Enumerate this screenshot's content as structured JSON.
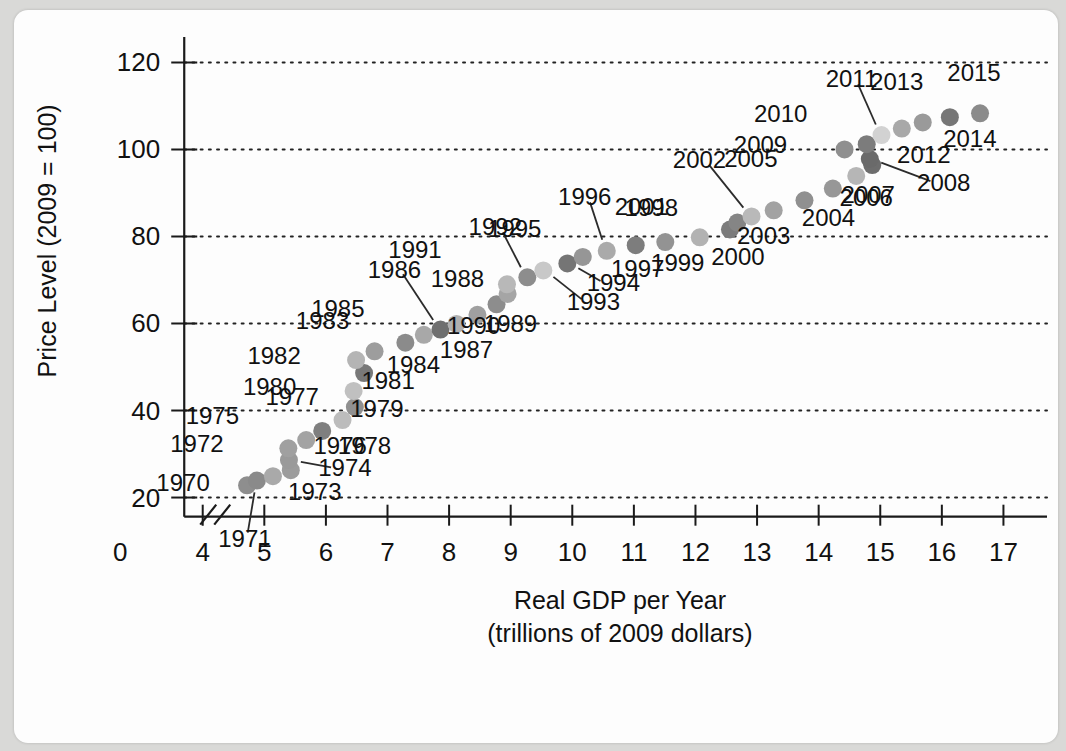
{
  "chart_data": {
    "type": "scatter",
    "title": "",
    "xlabel": "Real GDP per Year",
    "xlabel_line2": "(trillions of 2009 dollars)",
    "ylabel": "Price Level (2009 = 100)",
    "xlim": [
      3.55,
      17.35
    ],
    "ylim": [
      13.0,
      124.0
    ],
    "xticks": [
      4,
      5,
      6,
      7,
      8,
      9,
      10,
      11,
      12,
      13,
      14,
      15,
      16,
      17
    ],
    "yticks": [
      20,
      40,
      60,
      80,
      100,
      120
    ],
    "origin_label": "0",
    "axis_break": true,
    "grid": "horizontal-dotted",
    "legend": "none",
    "x_name": "Real GDP (trillions of 2009 dollars)",
    "y_name": "Price Level (2009 = 100)",
    "point_label_key": "year",
    "points": [
      {
        "year": "1970",
        "x": 4.72,
        "y": 22.8,
        "shade": "#8e8e8e",
        "label_dx": -64,
        "label_dy": 6,
        "leader": false
      },
      {
        "year": "1971",
        "x": 4.88,
        "y": 23.9,
        "shade": "#8a8a8a",
        "label_dx": -12,
        "label_dy": 66,
        "leader": true
      },
      {
        "year": "1972",
        "x": 5.14,
        "y": 24.9,
        "shade": "#a9a9a9",
        "label_dx": -76,
        "label_dy": -24,
        "leader": false
      },
      {
        "year": "1973",
        "x": 5.43,
        "y": 26.3,
        "shade": "#9c9c9c",
        "label_dx": 24,
        "label_dy": 30,
        "leader": false
      },
      {
        "year": "1974",
        "x": 5.4,
        "y": 28.6,
        "shade": "#9a9a9a",
        "label_dx": 56,
        "label_dy": 16,
        "leader": true
      },
      {
        "year": "1975",
        "x": 5.39,
        "y": 31.3,
        "shade": "#a0a0a0",
        "label_dx": -76,
        "label_dy": -24,
        "leader": false
      },
      {
        "year": "1976",
        "x": 5.68,
        "y": 33.2,
        "shade": "#a3a3a3",
        "label_dx": 34,
        "label_dy": 14,
        "leader": false
      },
      {
        "year": "1977",
        "x": 5.94,
        "y": 35.3,
        "shade": "#7f7f7f",
        "label_dx": -30,
        "label_dy": -26,
        "leader": false
      },
      {
        "year": "1978",
        "x": 6.27,
        "y": 37.8,
        "shade": "#bcbcbc",
        "label_dx": 22,
        "label_dy": 34,
        "leader": false
      },
      {
        "year": "1979",
        "x": 6.47,
        "y": 40.8,
        "shade": "#909090",
        "label_dx": 22,
        "label_dy": 10,
        "leader": false
      },
      {
        "year": "1980",
        "x": 6.45,
        "y": 44.5,
        "shade": "#c0c0c0",
        "label_dx": -84,
        "label_dy": 4,
        "leader": false
      },
      {
        "year": "1981",
        "x": 6.62,
        "y": 48.6,
        "shade": "#787878",
        "label_dx": 24,
        "label_dy": 16,
        "leader": false
      },
      {
        "year": "1982",
        "x": 6.49,
        "y": 51.6,
        "shade": "#b4b4b4",
        "label_dx": -82,
        "label_dy": 4,
        "leader": false
      },
      {
        "year": "1983",
        "x": 6.79,
        "y": 53.6,
        "shade": "#9d9d9d",
        "label_dx": -52,
        "label_dy": -22,
        "leader": false
      },
      {
        "year": "1984",
        "x": 7.29,
        "y": 55.6,
        "shade": "#8b8b8b",
        "label_dx": 8,
        "label_dy": 30,
        "leader": false
      },
      {
        "year": "1985",
        "x": 7.59,
        "y": 57.4,
        "shade": "#a8a8a8",
        "label_dx": -86,
        "label_dy": -18,
        "leader": false
      },
      {
        "year": "1986",
        "x": 7.86,
        "y": 58.6,
        "shade": "#6f6f6f",
        "label_dx": -46,
        "label_dy": -52,
        "leader": true
      },
      {
        "year": "1987",
        "x": 8.12,
        "y": 59.9,
        "shade": "#b0b0b0",
        "label_dx": 10,
        "label_dy": 34,
        "leader": false
      },
      {
        "year": "1988",
        "x": 8.46,
        "y": 62.0,
        "shade": "#a0a0a0",
        "label_dx": -20,
        "label_dy": -28,
        "leader": false
      },
      {
        "year": "1989",
        "x": 8.77,
        "y": 64.4,
        "shade": "#8d8d8d",
        "label_dx": 14,
        "label_dy": 28,
        "leader": false
      },
      {
        "year": "1990",
        "x": 8.95,
        "y": 66.8,
        "shade": "#a5a5a5",
        "label_dx": -34,
        "label_dy": 40,
        "leader": false
      },
      {
        "year": "1991",
        "x": 8.94,
        "y": 69.0,
        "shade": "#b8b8b8",
        "label_dx": -92,
        "label_dy": -26,
        "leader": false
      },
      {
        "year": "1992",
        "x": 9.27,
        "y": 70.6,
        "shade": "#8d8d8d",
        "label_dx": -32,
        "label_dy": -42,
        "leader": true
      },
      {
        "year": "1993",
        "x": 9.53,
        "y": 72.2,
        "shade": "#c8c8c8",
        "label_dx": 50,
        "label_dy": 40,
        "leader": true
      },
      {
        "year": "1994",
        "x": 9.92,
        "y": 73.8,
        "shade": "#757575",
        "label_dx": 46,
        "label_dy": 28,
        "leader": true
      },
      {
        "year": "1995",
        "x": 10.17,
        "y": 75.3,
        "shade": "#969696",
        "label_dx": -68,
        "label_dy": -20,
        "leader": false
      },
      {
        "year": "1996",
        "x": 10.56,
        "y": 76.7,
        "shade": "#aaaaaa",
        "label_dx": -22,
        "label_dy": -46,
        "leader": true
      },
      {
        "year": "1997",
        "x": 11.03,
        "y": 78.0,
        "shade": "#7d7d7d",
        "label_dx": 2,
        "label_dy": 32,
        "leader": false
      },
      {
        "year": "1998",
        "x": 11.51,
        "y": 78.7,
        "shade": "#939393",
        "label_dx": -14,
        "label_dy": -26,
        "leader": false
      },
      {
        "year": "1999",
        "x": 12.07,
        "y": 79.8,
        "shade": "#b2b2b2",
        "label_dx": -22,
        "label_dy": 34,
        "leader": false
      },
      {
        "year": "2000",
        "x": 12.56,
        "y": 81.6,
        "shade": "#7b7b7b",
        "label_dx": 8,
        "label_dy": 36,
        "leader": false
      },
      {
        "year": "2001",
        "x": 12.68,
        "y": 83.2,
        "shade": "#858585",
        "label_dx": -96,
        "label_dy": -8,
        "leader": false
      },
      {
        "year": "2002",
        "x": 12.91,
        "y": 84.6,
        "shade": "#b9b9b9",
        "label_dx": -52,
        "label_dy": -48,
        "leader": true
      },
      {
        "year": "2003",
        "x": 13.27,
        "y": 86.0,
        "shade": "#a2a2a2",
        "label_dx": -10,
        "label_dy": 34,
        "leader": false
      },
      {
        "year": "2004",
        "x": 13.77,
        "y": 88.3,
        "shade": "#909090",
        "label_dx": 24,
        "label_dy": 26,
        "leader": false
      },
      {
        "year": "2005",
        "x": 14.23,
        "y": 91.0,
        "shade": "#979797",
        "label_dx": -82,
        "label_dy": -22,
        "leader": false
      },
      {
        "year": "2006",
        "x": 14.61,
        "y": 93.9,
        "shade": "#b6b6b6",
        "label_dx": 10,
        "label_dy": 30,
        "leader": false
      },
      {
        "year": "2007",
        "x": 14.87,
        "y": 96.4,
        "shade": "#6d6d6d",
        "label_dx": -4,
        "label_dy": 38,
        "leader": false
      },
      {
        "year": "2008",
        "x": 14.83,
        "y": 97.8,
        "shade": "#6a6a6a",
        "label_dx": 74,
        "label_dy": 32,
        "leader": true
      },
      {
        "year": "2009",
        "x": 14.42,
        "y": 100.0,
        "shade": "#8f8f8f",
        "label_dx": -84,
        "label_dy": 4,
        "leader": false
      },
      {
        "year": "2010",
        "x": 14.78,
        "y": 101.2,
        "shade": "#7c7c7c",
        "label_dx": -86,
        "label_dy": -22,
        "leader": false
      },
      {
        "year": "2011",
        "x": 15.02,
        "y": 103.3,
        "shade": "#d2d2d2",
        "label_dx": -30,
        "label_dy": -48,
        "leader": true
      },
      {
        "year": "2012",
        "x": 15.35,
        "y": 104.8,
        "shade": "#a8a8a8",
        "label_dx": 22,
        "label_dy": 34,
        "leader": false
      },
      {
        "year": "2013",
        "x": 15.69,
        "y": 106.2,
        "shade": "#9a9a9a",
        "label_dx": -26,
        "label_dy": -32,
        "leader": false
      },
      {
        "year": "2014",
        "x": 16.13,
        "y": 107.4,
        "shade": "#767676",
        "label_dx": 20,
        "label_dy": 30,
        "leader": false
      },
      {
        "year": "2015",
        "x": 16.62,
        "y": 108.3,
        "shade": "#8b8b8b",
        "label_dx": -6,
        "label_dy": -32,
        "leader": false
      }
    ]
  },
  "figure": {
    "background": "#fdfdfd",
    "page_background": "#d9d9d7",
    "ink": "#111111",
    "dot_radius_px": 9
  }
}
